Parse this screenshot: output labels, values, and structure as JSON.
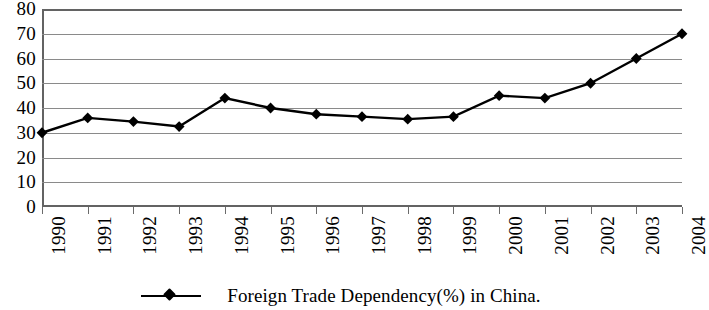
{
  "chart_data": {
    "type": "line",
    "title": "",
    "subtitle": "",
    "xlabel": "",
    "ylabel": "",
    "categories": [
      "1990",
      "1991",
      "1992",
      "1993",
      "1994",
      "1995",
      "1996",
      "1997",
      "1998",
      "1999",
      "2000",
      "2001",
      "2002",
      "2003",
      "2004"
    ],
    "series": [
      {
        "name": "Foreign Trade Dependency(%) in China.",
        "marker": "diamond",
        "color": "#000000",
        "values": [
          30,
          36,
          34.5,
          32.5,
          44,
          40,
          37.5,
          36.5,
          35.5,
          36.5,
          45,
          44,
          50,
          60,
          70
        ]
      }
    ],
    "ylim": [
      0,
      80
    ],
    "yticks": [
      0,
      10,
      20,
      30,
      40,
      50,
      60,
      70,
      80
    ],
    "ytick_labels": [
      "0",
      "10",
      "20",
      "30",
      "40",
      "50",
      "60",
      "70",
      "80"
    ],
    "grid": "horizontal",
    "legend_position": "bottom-center",
    "xtick_rotation": 90
  },
  "legend": {
    "entries": [
      {
        "label": "Foreign Trade Dependency(%) in China.",
        "marker": "line-diamond-marker"
      }
    ]
  },
  "colors": {
    "series_line": "#000000",
    "gridline": "#8a8a8a",
    "axis": "#636363",
    "background": "#ffffff",
    "text": "#000000"
  }
}
